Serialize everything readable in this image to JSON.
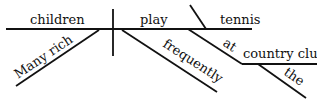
{
  "diagram": {
    "type": "sentence-diagram",
    "sentence": "Many rich children frequently play tennis at the country club",
    "subject": "children",
    "verb": "play",
    "direct_object": "tennis",
    "subject_modifiers": [
      "Many",
      "rich"
    ],
    "verb_modifiers": [
      "frequently"
    ],
    "prepositional_phrase": {
      "preposition": "at",
      "object": "country club",
      "modifiers": [
        "the"
      ]
    }
  }
}
